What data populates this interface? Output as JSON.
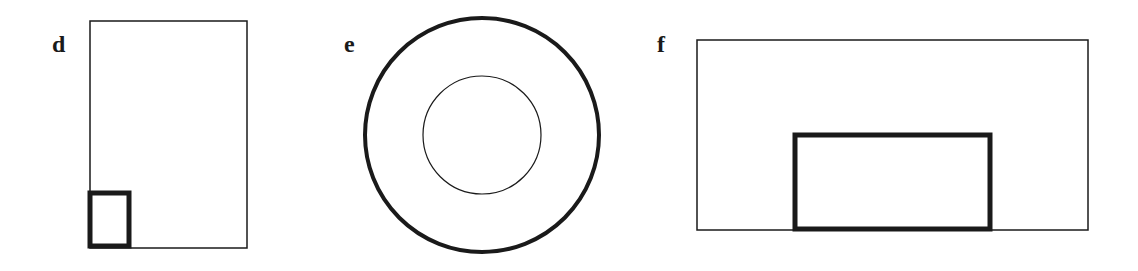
{
  "panels": [
    {
      "label": "d",
      "label_pos": [
        52,
        52
      ],
      "shapes": [
        {
          "type": "rect",
          "role": "outer",
          "x": 90,
          "y": 21,
          "w": 157,
          "h": 227,
          "stroke": 1.5
        },
        {
          "type": "rect",
          "role": "inner",
          "x": 90,
          "y": 193,
          "w": 39,
          "h": 53,
          "stroke": 5
        }
      ]
    },
    {
      "label": "e",
      "label_pos": [
        344,
        52
      ],
      "shapes": [
        {
          "type": "circle",
          "role": "outer",
          "cx": 482,
          "cy": 135,
          "r": 117,
          "stroke": 4
        },
        {
          "type": "circle",
          "role": "inner",
          "cx": 482,
          "cy": 135,
          "r": 59,
          "stroke": 1.2
        }
      ]
    },
    {
      "label": "f",
      "label_pos": [
        657,
        52
      ],
      "shapes": [
        {
          "type": "rect",
          "role": "outer",
          "x": 697,
          "y": 40,
          "w": 391,
          "h": 190,
          "stroke": 1.5
        },
        {
          "type": "rect",
          "role": "inner",
          "x": 795,
          "y": 135,
          "w": 195,
          "h": 94,
          "stroke": 5
        }
      ]
    }
  ],
  "colors": {
    "stroke": "#1a1a1a",
    "background": "#ffffff"
  }
}
